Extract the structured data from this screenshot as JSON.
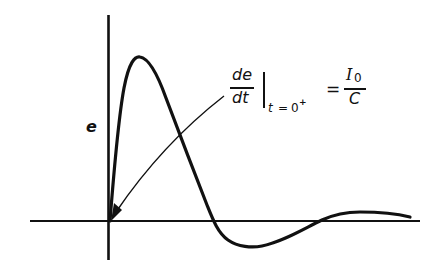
{
  "figure": {
    "type": "transient-response-curve",
    "y_axis_label": "e",
    "x_axis_label": "",
    "annotation": {
      "lhs_numerator": "de",
      "lhs_denominator": "dt",
      "evaluation_subscript_var": "t",
      "evaluation_subscript_eq": "=",
      "evaluation_subscript_val": "0",
      "evaluation_subscript_sup": "+",
      "equals": "=",
      "rhs_numerator_symbol": "I",
      "rhs_numerator_subscript": "0",
      "rhs_denominator": "C",
      "arrow_points_to": "origin (initial slope)"
    },
    "curve_description": "Voltage e starts at zero, rises steeply to a sharp peak, falls through zero, undershoots to a shallow negative minimum, then a small positive overshoot decaying toward zero.",
    "colors": {
      "ink": "#111111",
      "background": "#ffffff"
    }
  }
}
